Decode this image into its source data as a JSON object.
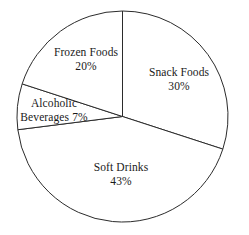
{
  "chart_data": {
    "type": "pie",
    "title": "",
    "subtitle": "",
    "xlabel": "",
    "ylabel": "",
    "legend": "none",
    "grid": false,
    "labels_inside_slices": true,
    "start_angle_deg": 0,
    "direction": "clockwise",
    "categories": [
      "Snack Foods",
      "Soft Drinks",
      "Alcoholic Beverages",
      "Frozen Foods"
    ],
    "values": [
      30,
      43,
      7,
      20
    ],
    "value_suffix": "%",
    "slices": [
      {
        "name": "Snack Foods",
        "value": 30,
        "label": "Snack Foods",
        "value_label": "30%",
        "start_deg": 0,
        "end_deg": 108,
        "color": "#ffffff",
        "stroke": "#2b2b2b"
      },
      {
        "name": "Soft Drinks",
        "value": 43,
        "label": "Soft Drinks",
        "value_label": "43%",
        "start_deg": 108,
        "end_deg": 262.8,
        "color": "#ffffff",
        "stroke": "#2b2b2b"
      },
      {
        "name": "Alcoholic Beverages",
        "value": 7,
        "label_line1": "Alcoholic",
        "label_line2": "Beverages",
        "value_label": "7%",
        "start_deg": 262.8,
        "end_deg": 288,
        "color": "#ffffff",
        "stroke": "#2b2b2b"
      },
      {
        "name": "Frozen Foods",
        "value": 20,
        "label": "Frozen Foods",
        "value_label": "20%",
        "start_deg": 288,
        "end_deg": 360,
        "color": "#ffffff",
        "stroke": "#2b2b2b"
      }
    ],
    "geometry": {
      "center_x": 122.5,
      "center_y": 116.5,
      "radius": 105.5
    },
    "style": {
      "background": "#ffffff",
      "stroke_color": "#2b2b2b",
      "stroke_width": 1,
      "text_color": "#1a1a1a"
    }
  }
}
